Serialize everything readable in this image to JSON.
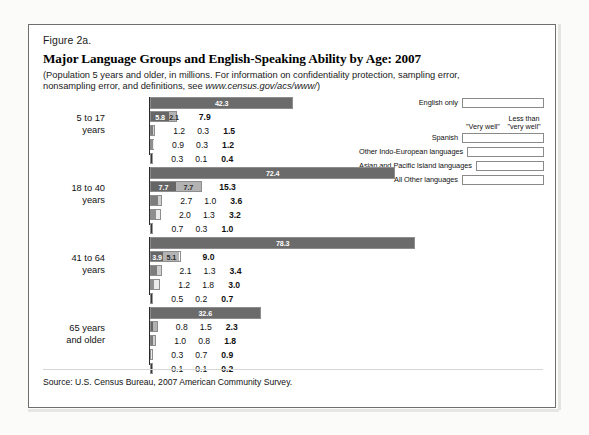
{
  "figure": {
    "label": "Figure 2a.",
    "title": "Major Language Groups and English-Speaking Ability by Age: 2007",
    "subtitle_part1": "(Population 5 years and older, in millions. For information on confidentiality protection, sampling error, nonsampling error, and definitions, see ",
    "subtitle_url": "www.census.gov/acs/www/",
    "subtitle_part2": ")",
    "source": "Source: U.S. Census Bureau, 2007 American Community Survey."
  },
  "legend": {
    "head_very_well": "\"Very well\"",
    "head_less_than": "Less than\n\"very well\"",
    "head_less_than_line1": "Less than",
    "head_less_than_line2": "\"very well\"",
    "items": [
      {
        "label": "English only",
        "color_a": "#6b6b6b",
        "color_b": "#6b6b6b"
      },
      {
        "label": "Spanish",
        "color_a": "#666666",
        "color_b": "#b3b3b3"
      },
      {
        "label": "Other Indo-European languages",
        "color_a": "#7d7d7d",
        "color_b": "#cfcfcf"
      },
      {
        "label": "Asian and Pacific Island languages",
        "color_a": "#8f8f8f",
        "color_b": "#ebebeb"
      },
      {
        "label": "All Other languages",
        "color_a": "#363636",
        "color_b": "#9a9a9a"
      }
    ]
  },
  "chart_data": {
    "type": "bar",
    "title": "Major Language Groups and English-Speaking Ability by Age: 2007",
    "subtitle": "(Population 5 years and older, in millions.)",
    "xlabel": "Population (millions)",
    "ylabel": "",
    "grid": false,
    "legend_position": "top-right",
    "units": "millions",
    "series_names": [
      "\"Very well\"",
      "Less than \"very well\""
    ],
    "categories": [
      "5 to 17 years",
      "18 to 40 years",
      "41 to 64 years",
      "65 years and older"
    ],
    "groups": [
      {
        "age": "5 to 17",
        "age_line1": "5 to 17",
        "age_line2": "years",
        "rows": [
          {
            "language": "English only",
            "total": "42.3",
            "total_value": 42.3,
            "very_well": null,
            "less_than": null,
            "seg_labels": [
              "42.3"
            ],
            "seg_values": [
              42.3
            ]
          },
          {
            "language": "Spanish",
            "total": "7.9",
            "total_value": 7.9,
            "very_well": "5.8",
            "less_than": "2.1",
            "seg_labels": [
              "5.8",
              "2.1"
            ],
            "seg_values": [
              5.8,
              2.1
            ]
          },
          {
            "language": "Other Indo-European languages",
            "total": "1.5",
            "total_value": 1.5,
            "very_well": "1.2",
            "less_than": "0.3",
            "seg_labels": [],
            "seg_values": [
              1.2,
              0.3
            ]
          },
          {
            "language": "Asian and Pacific Island languages",
            "total": "1.2",
            "total_value": 1.2,
            "very_well": "0.9",
            "less_than": "0.3",
            "seg_labels": [],
            "seg_values": [
              0.9,
              0.3
            ]
          },
          {
            "language": "All Other languages",
            "total": "0.4",
            "total_value": 0.4,
            "very_well": "0.3",
            "less_than": "0.1",
            "seg_labels": [],
            "seg_values": [
              0.3,
              0.1
            ]
          }
        ]
      },
      {
        "age": "18 to 40",
        "age_line1": "18 to 40",
        "age_line2": "years",
        "rows": [
          {
            "language": "English only",
            "total": "72.4",
            "total_value": 72.4,
            "very_well": null,
            "less_than": null,
            "seg_labels": [
              "72.4"
            ],
            "seg_values": [
              72.4
            ]
          },
          {
            "language": "Spanish",
            "total": "15.3",
            "total_value": 15.3,
            "very_well": "7.7",
            "less_than": "7.7",
            "seg_labels": [
              "7.7",
              "7.7"
            ],
            "seg_values": [
              7.7,
              7.7
            ]
          },
          {
            "language": "Other Indo-European languages",
            "total": "3.6",
            "total_value": 3.6,
            "very_well": "2.7",
            "less_than": "1.0",
            "seg_labels": [],
            "seg_values": [
              2.7,
              1.0
            ]
          },
          {
            "language": "Asian and Pacific Island languages",
            "total": "3.2",
            "total_value": 3.2,
            "very_well": "2.0",
            "less_than": "1.3",
            "seg_labels": [],
            "seg_values": [
              2.0,
              1.3
            ]
          },
          {
            "language": "All Other languages",
            "total": "1.0",
            "total_value": 1.0,
            "very_well": "0.7",
            "less_than": "0.3",
            "seg_labels": [],
            "seg_values": [
              0.7,
              0.3
            ]
          }
        ]
      },
      {
        "age": "41 to 64",
        "age_line1": "41 to 64",
        "age_line2": "years",
        "rows": [
          {
            "language": "English only",
            "total": "78.3",
            "total_value": 78.3,
            "very_well": null,
            "less_than": null,
            "seg_labels": [
              "78.3"
            ],
            "seg_values": [
              78.3
            ]
          },
          {
            "language": "Spanish",
            "total": "9.0",
            "total_value": 9.0,
            "very_well": "3.9",
            "less_than": "5.1",
            "seg_labels": [
              "3.9",
              "5.1"
            ],
            "seg_values": [
              3.9,
              5.1
            ]
          },
          {
            "language": "Other Indo-European languages",
            "total": "3.4",
            "total_value": 3.4,
            "very_well": "2.1",
            "less_than": "1.3",
            "seg_labels": [],
            "seg_values": [
              2.1,
              1.3
            ]
          },
          {
            "language": "Asian and Pacific Island languages",
            "total": "3.0",
            "total_value": 3.0,
            "very_well": "1.2",
            "less_than": "1.8",
            "seg_labels": [],
            "seg_values": [
              1.2,
              1.8
            ]
          },
          {
            "language": "All Other languages",
            "total": "0.7",
            "total_value": 0.7,
            "very_well": "0.5",
            "less_than": "0.2",
            "seg_labels": [],
            "seg_values": [
              0.5,
              0.2
            ]
          }
        ]
      },
      {
        "age": "65 years and older",
        "age_line1": "65 years",
        "age_line2": "and older",
        "rows": [
          {
            "language": "English only",
            "total": "32.6",
            "total_value": 32.6,
            "very_well": null,
            "less_than": null,
            "seg_labels": [
              "32.6"
            ],
            "seg_values": [
              32.6
            ]
          },
          {
            "language": "Spanish",
            "total": "2.3",
            "total_value": 2.3,
            "very_well": "0.8",
            "less_than": "1.5",
            "seg_labels": [],
            "seg_values": [
              0.8,
              1.5
            ]
          },
          {
            "language": "Other Indo-European languages",
            "total": "1.8",
            "total_value": 1.8,
            "very_well": "1.0",
            "less_than": "0.8",
            "seg_labels": [],
            "seg_values": [
              1.0,
              0.8
            ]
          },
          {
            "language": "Asian and Pacific Island languages",
            "total": "0.9",
            "total_value": 0.9,
            "very_well": "0.3",
            "less_than": "0.7",
            "seg_labels": [],
            "seg_values": [
              0.3,
              0.7
            ]
          },
          {
            "language": "All Other languages",
            "total": "0.2",
            "total_value": 0.2,
            "very_well": "0.1",
            "less_than": "0.1",
            "seg_labels": [],
            "seg_values": [
              0.1,
              0.1
            ]
          }
        ]
      }
    ]
  }
}
